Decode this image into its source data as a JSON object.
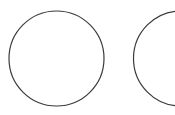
{
  "canvas": {
    "width": 175,
    "height": 115,
    "background_color": "#ffffff",
    "title": "Two outlined circles"
  },
  "style": {
    "stroke_color": "#3a3a3a",
    "stroke_width": 1.2,
    "fill": "none"
  },
  "shapes": [
    {
      "name": "circle-left",
      "type": "circle",
      "cx": 56.5,
      "cy": 58.5,
      "r": 47.5,
      "clipped": false,
      "stroke_color": "#3a3a3a",
      "stroke_width": 1.2,
      "fill": "none"
    },
    {
      "name": "circle-right",
      "type": "circle",
      "cx": 181,
      "cy": 58.5,
      "r": 47.5,
      "clipped": true,
      "stroke_color": "#3a3a3a",
      "stroke_width": 1.2,
      "fill": "none"
    }
  ]
}
